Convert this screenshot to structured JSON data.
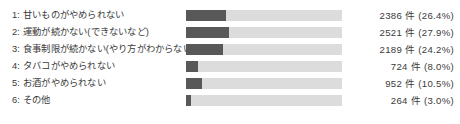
{
  "chart_data": {
    "type": "bar",
    "title": "",
    "subtitle": "",
    "xlabel": "",
    "ylabel": "",
    "orientation": "horizontal",
    "grid": false,
    "legend": "none",
    "axis_visible": false,
    "xlim": [
      0,
      9041
    ],
    "categories": [
      "1: 甘いものがやめられない",
      "2: 運動が続かない(できないなど)",
      "3: 食事制限が続かない(やり方がわからないなど)",
      "4: タバコがやめられない",
      "5: お酒がやめられない",
      "6: その他"
    ],
    "values": [
      2386,
      2521,
      2189,
      724,
      952,
      264
    ],
    "percents": [
      26.4,
      27.9,
      24.2,
      8.0,
      10.5,
      3.0
    ],
    "value_labels": [
      "2386 件 (26.4%)",
      "2521 件 (27.9%)",
      "2189 件 (24.2%)",
      "724 件 (8.0%)",
      "952 件 (10.5%)",
      "264 件 (3.0%)"
    ],
    "unit": "件",
    "bar_fill_fractions": [
      0.258,
      0.273,
      0.237,
      0.078,
      0.103,
      0.029
    ],
    "colors": {
      "bar_fill": "#585858",
      "bar_track": "#dcdcdc",
      "text": "#3a3a3a",
      "background": "#ffffff"
    }
  },
  "rows": [
    {
      "index": "1",
      "label": "1: 甘いものがやめられない",
      "value_label": "2386 件 (26.4%)",
      "count": 2386,
      "percent": 26.4,
      "fill_fraction": 0.258
    },
    {
      "index": "2",
      "label": "2: 運動が続かない(できないなど)",
      "value_label": "2521 件 (27.9%)",
      "count": 2521,
      "percent": 27.9,
      "fill_fraction": 0.273
    },
    {
      "index": "3",
      "label": "3: 食事制限が続かない(やり方がわからないなど)",
      "value_label": "2189 件 (24.2%)",
      "count": 2189,
      "percent": 24.2,
      "fill_fraction": 0.237
    },
    {
      "index": "4",
      "label": "4: タバコがやめられない",
      "value_label": "724 件 (8.0%)",
      "count": 724,
      "percent": 8.0,
      "fill_fraction": 0.078
    },
    {
      "index": "5",
      "label": "5: お酒がやめられない",
      "value_label": "952 件 (10.5%)",
      "count": 952,
      "percent": 10.5,
      "fill_fraction": 0.103
    },
    {
      "index": "6",
      "label": "6: その他",
      "value_label": "264 件 (3.0%)",
      "count": 264,
      "percent": 3.0,
      "fill_fraction": 0.029
    }
  ]
}
